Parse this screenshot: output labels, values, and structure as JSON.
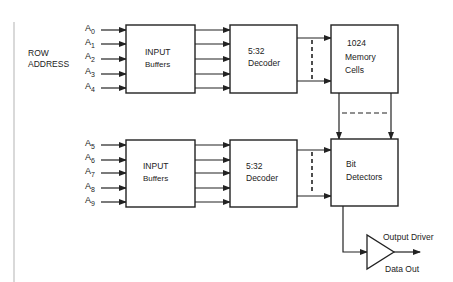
{
  "diagram": {
    "row_address_label": [
      "ROW",
      "ADDRESS"
    ],
    "top_group": {
      "address_lines": [
        {
          "base": "A",
          "sub": "0"
        },
        {
          "base": "A",
          "sub": "1"
        },
        {
          "base": "A",
          "sub": "2"
        },
        {
          "base": "A",
          "sub": "3"
        },
        {
          "base": "A",
          "sub": "4"
        }
      ],
      "buffers": [
        "INPUT",
        "Buffers"
      ],
      "decoder": [
        "5:32",
        "Decoder"
      ],
      "memory": [
        "1024",
        "Memory",
        "Cells"
      ]
    },
    "bottom_group": {
      "address_lines": [
        {
          "base": "A",
          "sub": "5"
        },
        {
          "base": "A",
          "sub": "6"
        },
        {
          "base": "A",
          "sub": "7"
        },
        {
          "base": "A",
          "sub": "8"
        },
        {
          "base": "A",
          "sub": "9"
        }
      ],
      "buffers": [
        "INPUT",
        "Buffers"
      ],
      "decoder": [
        "5:32",
        "Decoder"
      ],
      "detectors": [
        "Bit",
        "Detectors"
      ]
    },
    "output_driver_label": "Output Driver",
    "data_out_label": "Data Out",
    "colors": {
      "line": "#222222",
      "margin_rule": "#cccccc",
      "background": "#ffffff"
    }
  }
}
